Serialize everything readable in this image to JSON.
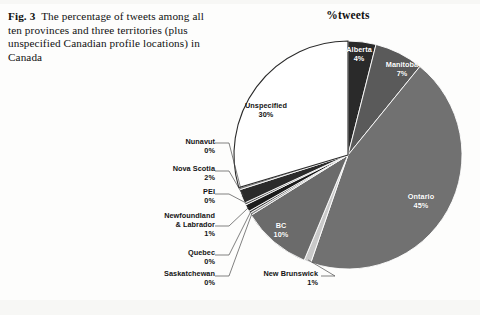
{
  "caption": {
    "fig_label": "Fig. 3",
    "text": "The percentage of tweets among all ten provinces and three territories (plus unspecified Canadian profile locations) in Canada"
  },
  "chart_data": {
    "type": "pie",
    "title": "%tweets",
    "xlabel": "",
    "ylabel": "",
    "legend": "none",
    "grid": false,
    "units": "percent",
    "categories": [
      "Alberta",
      "Manitoba",
      "Ontario",
      "New Brunswick",
      "BC",
      "Saskatchewan",
      "Quebec",
      "Newfoundland & Labrador",
      "PEI",
      "Nova Scotia",
      "Nunavut",
      "Unspecified"
    ],
    "values": [
      4,
      7,
      45,
      1,
      10,
      0,
      0,
      1,
      0,
      2,
      0,
      30
    ],
    "value_labels": [
      "4%",
      "7%",
      "45%",
      "1%",
      "10%",
      "0%",
      "0%",
      "1%",
      "0%",
      "2%",
      "0%",
      "30%"
    ],
    "slice_colors": [
      "#2a2a2a",
      "#5a5a5a",
      "#717171",
      "#c9c9c9",
      "#6b6b6b",
      "#8a8a8a",
      "#3d3d3d",
      "#1c1c1c",
      "#555555",
      "#2b2b2b",
      "#7d7d7d",
      "#ffffff"
    ],
    "slices": [
      {
        "name": "Alberta",
        "value": 4,
        "label": "Alberta",
        "pct": "4%",
        "color": "#2a2a2a"
      },
      {
        "name": "Manitoba",
        "value": 7,
        "label": "Manitoba",
        "pct": "7%",
        "color": "#5a5a5a"
      },
      {
        "name": "Ontario",
        "value": 45,
        "label": "Ontario",
        "pct": "45%",
        "color": "#717171"
      },
      {
        "name": "New Brunswick",
        "value": 1,
        "label": "New Brunswick",
        "pct": "1%",
        "color": "#c9c9c9"
      },
      {
        "name": "BC",
        "value": 10,
        "label": "BC",
        "pct": "10%",
        "color": "#6b6b6b"
      },
      {
        "name": "Saskatchewan",
        "value": 0,
        "label": "Saskatchewan",
        "pct": "0%",
        "color": "#8a8a8a"
      },
      {
        "name": "Quebec",
        "value": 0,
        "label": "Quebec",
        "pct": "0%",
        "color": "#3d3d3d"
      },
      {
        "name": "Newfoundland & Labrador",
        "value": 1,
        "label": "Newfoundland & Labrador",
        "pct": "1%",
        "color": "#1c1c1c"
      },
      {
        "name": "PEI",
        "value": 0,
        "label": "PEI",
        "pct": "0%",
        "color": "#555555"
      },
      {
        "name": "Nova Scotia",
        "value": 2,
        "label": "Nova Scotia",
        "pct": "2%",
        "color": "#2b2b2b"
      },
      {
        "name": "Nunavut",
        "value": 0,
        "label": "Nunavut",
        "pct": "0%",
        "color": "#7d7d7d"
      },
      {
        "name": "Unspecified",
        "value": 30,
        "label": "Unspecified",
        "pct": "30%",
        "color": "#ffffff"
      }
    ]
  },
  "labels": {
    "alberta_name": "Alberta",
    "alberta_pct": "4%",
    "manitoba_name": "Manitoba",
    "manitoba_pct": "7%",
    "ontario_name": "Ontario",
    "ontario_pct": "45%",
    "bc_name": "BC",
    "bc_pct": "10%",
    "unspecified_name": "Unspecified",
    "unspecified_pct": "30%",
    "nunavut_name": "Nunavut",
    "nunavut_pct": "0%",
    "novascotia_name": "Nova Scotia",
    "novascotia_pct": "2%",
    "pei_name": "PEI",
    "pei_pct": "0%",
    "nl_name_1": "Newfoundland",
    "nl_name_2": "& Labrador",
    "nl_pct": "1%",
    "quebec_name": "Quebec",
    "quebec_pct": "0%",
    "saskatchewan_name": "Saskatchewan",
    "saskatchewan_pct": "0%",
    "newbrunswick_name": "New Brunswick",
    "newbrunswick_pct": "1%"
  }
}
